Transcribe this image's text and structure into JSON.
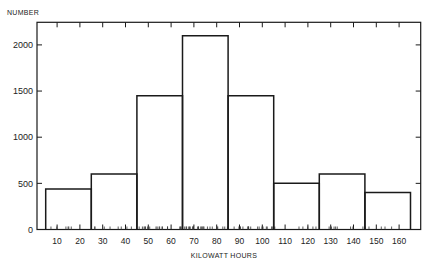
{
  "chart_data": {
    "type": "bar",
    "subtype": "histogram",
    "title": "",
    "ylabel": "NUMBER",
    "xlabel": "KILOWATT HOURS",
    "bins": [
      {
        "from": 5,
        "to": 25,
        "value": 440
      },
      {
        "from": 25,
        "to": 45,
        "value": 600
      },
      {
        "from": 45,
        "to": 65,
        "value": 1450
      },
      {
        "from": 65,
        "to": 85,
        "value": 2100
      },
      {
        "from": 85,
        "to": 105,
        "value": 1450
      },
      {
        "from": 105,
        "to": 125,
        "value": 500
      },
      {
        "from": 125,
        "to": 145,
        "value": 600
      },
      {
        "from": 145,
        "to": 165,
        "value": 400
      }
    ],
    "categories": [
      "5-25",
      "25-45",
      "45-65",
      "65-85",
      "85-105",
      "105-125",
      "125-145",
      "145-165"
    ],
    "values": [
      440,
      600,
      1450,
      2100,
      1450,
      500,
      600,
      400
    ],
    "xlim": [
      1,
      170
    ],
    "ylim": [
      0,
      2250
    ],
    "yticks": [
      0,
      500,
      1000,
      1500,
      2000
    ],
    "ytick_labels": [
      "0",
      "500",
      "1000",
      "1500",
      "2000"
    ],
    "xticks": [
      10,
      20,
      30,
      40,
      50,
      60,
      70,
      80,
      90,
      100,
      110,
      120,
      130,
      140,
      150,
      160
    ],
    "xtick_labels": [
      "10",
      "20",
      "30",
      "40",
      "50",
      "60",
      "70",
      "80",
      "90",
      "100",
      "110",
      "120",
      "130",
      "140",
      "150",
      "160"
    ],
    "grid": false,
    "legend": null,
    "rug_marks": true
  },
  "axes": {
    "ylabel": "NUMBER",
    "xlabel": "KILOWATT HOURS"
  }
}
